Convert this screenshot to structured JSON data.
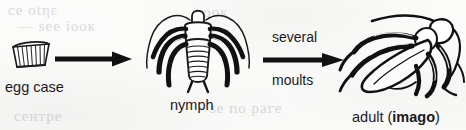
{
  "diagram": {
    "background_color": "#fbfbfa",
    "ink_color": "#1a1a1a",
    "stages": [
      {
        "id": "egg-case",
        "label": "egg case",
        "icon": "ootheca-egg-case-drawing"
      },
      {
        "id": "nymph",
        "label": "nymph",
        "icon": "cockroach-nymph-drawing"
      },
      {
        "id": "adult",
        "label_prefix": "adult (",
        "label_emphasis": "imago",
        "label_suffix": ")",
        "icon": "adult-cockroach-drawing"
      }
    ],
    "arrows": [
      {
        "id": "arrow-egg-to-nymph",
        "icon": "right-arrow-icon",
        "label_above": "",
        "label_below": ""
      },
      {
        "id": "arrow-nymph-to-adult",
        "icon": "right-arrow-icon",
        "label_above": "several",
        "label_below": "moults"
      }
    ],
    "ghost_text": [
      {
        "text": "се οtηε",
        "x": 8,
        "y": 2
      },
      {
        "text": "— ѕее іоок",
        "x": 18,
        "y": 18
      },
      {
        "text": "тоок",
        "x": 196,
        "y": 4
      },
      {
        "text": "ѕе по раге",
        "x": 210,
        "y": 100
      },
      {
        "text": "сентре",
        "x": 14,
        "y": 108
      }
    ]
  }
}
